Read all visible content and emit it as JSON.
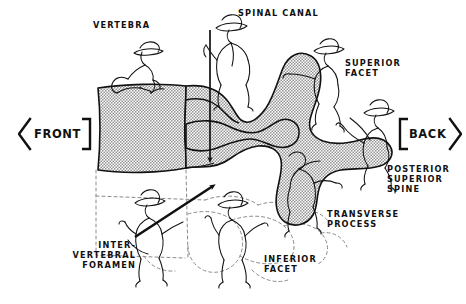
{
  "figure": {
    "type": "anatomical-line-illustration",
    "background_color": "#ffffff",
    "ink_color": "#111111",
    "bone_fill_color": "#c9c9c9",
    "dashed_outline_color": "#8a8a8a"
  },
  "direction_markers": {
    "front": {
      "label": "FRONT",
      "glyph": "left-arrow-bracket"
    },
    "back": {
      "label": "BACK",
      "glyph": "right-arrow-bracket"
    }
  },
  "labels": {
    "vertebra": {
      "text": "VERTEBRA",
      "align": "left"
    },
    "spinal_canal": {
      "text": "SPINAL CANAL",
      "align": "left"
    },
    "superior_facet": {
      "text": "SUPERIOR\nFACET",
      "align": "left"
    },
    "posterior_superior_spine": {
      "text": "POSTERIOR\nSUPERIOR\nSPINE",
      "align": "left"
    },
    "transverse_process": {
      "text": "TRANSVERSE\nPROCESS",
      "align": "left"
    },
    "inferior_facet": {
      "text": "INFERIOR\nFACET",
      "align": "left"
    },
    "intervertebral_foramen": {
      "text": "INTER-\nVERTEBRAL\nFORAMEN",
      "align": "right"
    }
  },
  "pointers": {
    "spinal_canal_arrow": "vertical down arrow into the spinal canal",
    "intervertebral_foramen_arrow": "diagonal up-right arrow into the foramen"
  },
  "figures": [
    {
      "name": "vertebra-worker",
      "pose": "crouching on top of vertebral body",
      "hat": "brimmed-hat"
    },
    {
      "name": "spinal-canal-worker",
      "pose": "standing holding vertical pole",
      "hat": "brimmed-hat"
    },
    {
      "name": "superior-facet-worker",
      "pose": "running to the right, arm extended",
      "hat": "brimmed-hat"
    },
    {
      "name": "posterior-superior-spine-worker",
      "pose": "striding right, carrying load",
      "hat": "brimmed-hat"
    },
    {
      "name": "transverse-process-worker",
      "pose": "bent over pushing",
      "hat": "none"
    },
    {
      "name": "inferior-facet-worker",
      "pose": "standing, arms raised",
      "hat": "brimmed-hat"
    },
    {
      "name": "intervertebral-foramen-worker",
      "pose": "holding long spear angled up-right",
      "hat": "brimmed-hat"
    }
  ]
}
